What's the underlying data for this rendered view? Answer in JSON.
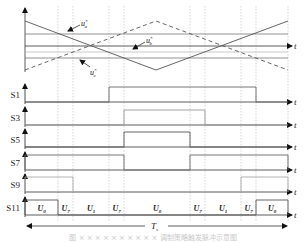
{
  "figure": {
    "refs": {
      "ua": {
        "base": "u",
        "sup": "*",
        "sub": "a"
      },
      "ub": {
        "base": "u",
        "sup": "*",
        "sub": "b"
      },
      "uc": {
        "base": "u",
        "sup": "*",
        "sub": "c"
      }
    },
    "time_label": "t",
    "period_label": {
      "base": "T",
      "sub": "s"
    },
    "signals": [
      {
        "name": "S1",
        "high": [
          [
            3,
            8
          ]
        ],
        "color": "#666666"
      },
      {
        "name": "S3",
        "high": [
          [
            4,
            6
          ]
        ],
        "color": "#999999"
      },
      {
        "name": "S5",
        "high": [
          [
            4,
            5
          ]
        ],
        "color": "#555555"
      },
      {
        "name": "S7",
        "high": [
          [
            0,
            4
          ],
          [
            5,
            9
          ]
        ],
        "color": "#666666"
      },
      {
        "name": "S9",
        "high": [
          [
            0,
            2
          ],
          [
            7,
            9
          ]
        ],
        "color": "#aaaaaa"
      },
      {
        "name": "S11",
        "high": [
          [
            0,
            1
          ],
          [
            8,
            9
          ]
        ],
        "color": "#555555"
      }
    ],
    "segments": [
      {
        "base": "U",
        "sub": "0"
      },
      {
        "base": "U",
        "sub": "7"
      },
      {
        "base": "U",
        "sub": "1"
      },
      {
        "base": "U",
        "sub": "7"
      },
      {
        "base": "U",
        "sub": "0"
      },
      {
        "base": "U",
        "sub": "7"
      },
      {
        "base": "U",
        "sub": "1"
      },
      {
        "base": "U",
        "sub": "7"
      },
      {
        "base": "U",
        "sub": "0"
      }
    ],
    "caption": "图 × ×  ×  ×  × ×  ×  ×  ×  ×  调制策略触发脉冲示意图"
  }
}
